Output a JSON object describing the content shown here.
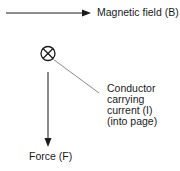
{
  "diagram": {
    "labels": {
      "magnetic_field": "Magnetic field (B)",
      "force": "Force (F)",
      "conductor": [
        "Conductor",
        "carrying",
        "current (I)",
        "(into page)"
      ]
    },
    "symbols": {
      "conductor_symbol": "circle-with-cross (current into page)",
      "field_arrow": "arrow pointing right",
      "force_arrow": "arrow pointing down",
      "leader_line": "thin line from conductor to label"
    },
    "colors": {
      "stroke": "#1a1a1a",
      "leader": "#6b6b6b",
      "background": "#ffffff"
    }
  }
}
